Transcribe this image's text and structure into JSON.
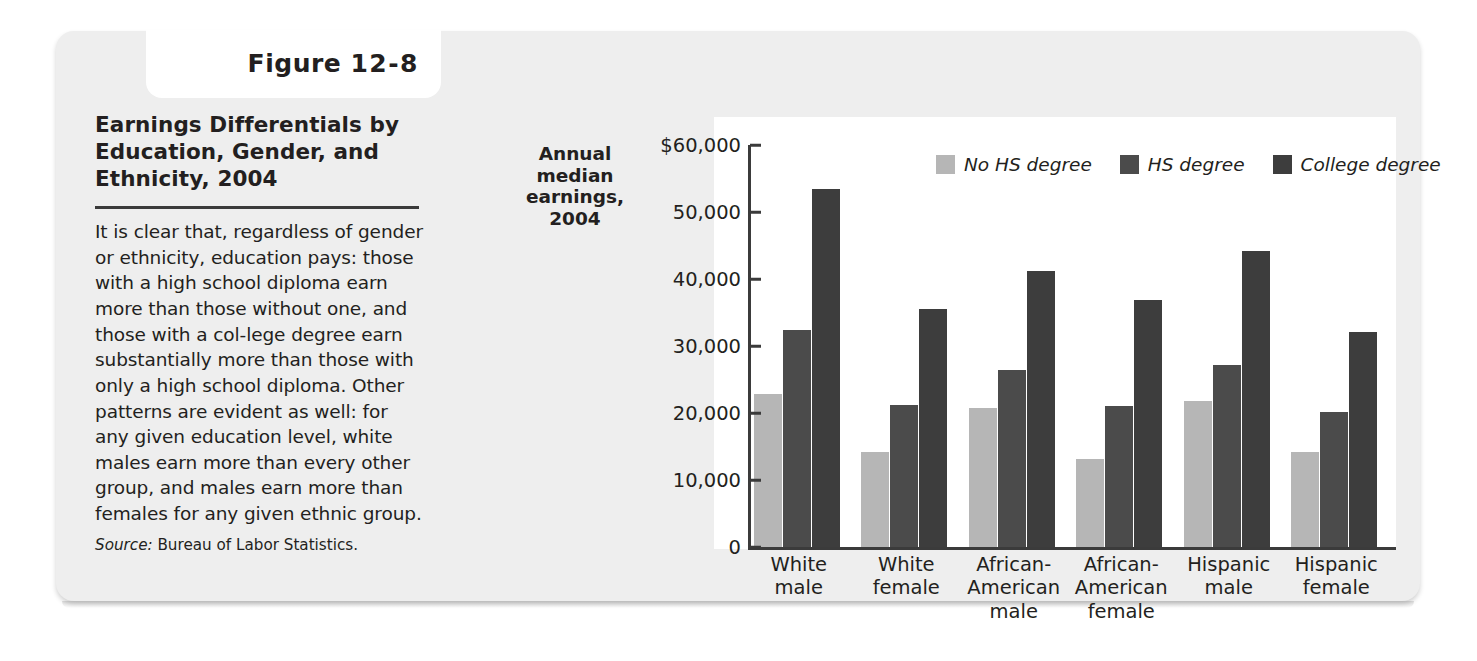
{
  "figure": {
    "tab_label_prefix": "Figure",
    "tab_label_number": "12-8",
    "title": "Earnings Differentials by Education, Gender, and Ethnicity, 2004",
    "body": "It is clear that, regardless of gender or ethnicity, education pays: those with a high school diploma earn more than those without one, and those with a col-lege degree earn substantially more than those with only a high school diploma. Other patterns are evident as well: for any given education level, white males earn more than every other group, and males earn more than females for any given ethnic group.",
    "source_word": "Source:",
    "source_text": " Bureau of Labor Statistics."
  },
  "colors": {
    "panel_bg": "#eeeeee",
    "plot_bg": "#ffffff",
    "axis": "#3b3b3b",
    "no_hs_degree": "#b6b6b6",
    "hs_degree": "#4b4b4b",
    "college_degree": "#3d3d3d",
    "text": "#231f20"
  },
  "chart_data": {
    "type": "bar",
    "title": "",
    "xlabel": "",
    "ylabel": "Annual median earnings, 2004",
    "ylim": [
      0,
      60000
    ],
    "grid": false,
    "legend_position": "top-right",
    "ytick_labels": [
      "$60,000",
      "50,000",
      "40,000",
      "30,000",
      "20,000",
      "10,000",
      "0"
    ],
    "yticks": [
      60000,
      50000,
      40000,
      30000,
      20000,
      10000,
      0
    ],
    "categories": [
      "White male",
      "White female",
      "African-American male",
      "African-American female",
      "Hispanic male",
      "Hispanic female"
    ],
    "category_lines": [
      [
        "White",
        "male"
      ],
      [
        "White",
        "female"
      ],
      [
        "African-",
        "American",
        "male"
      ],
      [
        "African-",
        "American",
        "female"
      ],
      [
        "Hispanic",
        "male"
      ],
      [
        "Hispanic",
        "female"
      ]
    ],
    "series": [
      {
        "name": "No HS degree",
        "color": "#b6b6b6",
        "values": [
          22800,
          14200,
          20700,
          13200,
          21800,
          14200
        ]
      },
      {
        "name": "HS degree",
        "color": "#4b4b4b",
        "values": [
          32400,
          21200,
          26400,
          21100,
          27100,
          20200
        ]
      },
      {
        "name": "College degree",
        "color": "#3d3d3d",
        "values": [
          53500,
          35500,
          41200,
          36900,
          44200,
          32100
        ]
      }
    ]
  }
}
